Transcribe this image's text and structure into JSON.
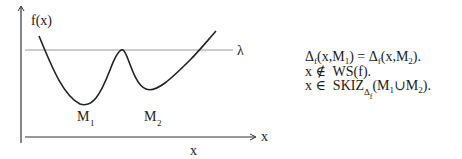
{
  "diagram": {
    "y_axis_label": "f(x)",
    "x_axis_arrow_label": "x",
    "x_axis_below_label": "x",
    "threshold_label": "λ",
    "minima": [
      {
        "label": "M",
        "sub": "1"
      },
      {
        "label": "M",
        "sub": "2"
      }
    ]
  },
  "equations": {
    "line1": {
      "lhs_delta": "Δ",
      "lhs_sub": "f",
      "lhs_args_a": "(x,M",
      "lhs_args_sub": "1",
      "lhs_args_b": ")",
      "equals": " = ",
      "rhs_delta": "Δ",
      "rhs_sub": "f",
      "rhs_args_a": "(x,M",
      "rhs_args_sub": "2",
      "rhs_args_b": ")."
    },
    "line2": {
      "text": "x ∉  WS(f)."
    },
    "line3": {
      "prefix": "x ∈  SKIZ",
      "sub_delta": "Δ",
      "sub_sub": "f",
      "args_a": "(M",
      "args_sub1": "1",
      "args_mid": "∪M",
      "args_sub2": "2",
      "args_b": ")."
    }
  }
}
